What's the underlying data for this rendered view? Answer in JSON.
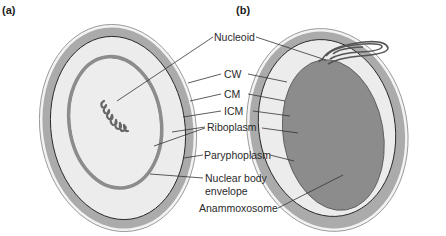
{
  "figure": {
    "panels": [
      {
        "id": "a",
        "label": "(a)"
      },
      {
        "id": "b",
        "label": "(b)"
      }
    ],
    "labels": {
      "nucleoid": "Nucleoid",
      "cw": "CW",
      "cm": "CM",
      "icm": "ICM",
      "riboplasm": "Riboplasm",
      "paryphoplasm": "Paryphoplasm",
      "nuclear_body_line1": "Nuclear body",
      "nuclear_body_line2": "envelope",
      "anammoxosome": "Anammoxosome"
    },
    "colors": {
      "background": "#ffffff",
      "cell_wall": "#f2f2f2",
      "paryphoplasm": "#a9a9a9",
      "riboplasm": "#e9e9e9",
      "nuclear_envelope": "#8c8c8c",
      "anammoxosome": "#8a8a8a",
      "nucleoid": "#6a6a6a",
      "lines": "#333333"
    }
  }
}
